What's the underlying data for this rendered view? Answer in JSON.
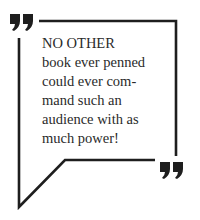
{
  "quote": {
    "lines": [
      "NO OTHER",
      "book ever penned",
      "could ever com-",
      "mand such an",
      "audience with as",
      "much power!"
    ]
  },
  "icons": {
    "open_quote": "closing-double-quote-mark",
    "close_quote": "closing-double-quote-mark"
  },
  "colors": {
    "stroke": "#1e1e1e",
    "text": "#2a2a2a",
    "background": "#ffffff"
  }
}
